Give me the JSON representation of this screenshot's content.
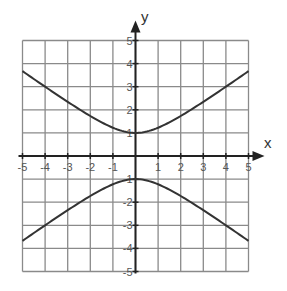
{
  "chart_data": {
    "type": "line",
    "title": "",
    "xlabel": "x",
    "ylabel": "y",
    "xlim": [
      -5,
      5
    ],
    "ylim": [
      -5,
      5
    ],
    "grid": true,
    "legend": null,
    "x_ticks": [
      "-5",
      "-4",
      "-3",
      "-2",
      "-1",
      "1",
      "2",
      "3",
      "4",
      "5"
    ],
    "y_ticks": [
      "5",
      "4",
      "3",
      "2",
      "1",
      "-1",
      "-2",
      "-3",
      "-4",
      "-5"
    ],
    "equation": "y^2 - x^2/2 = 1",
    "series": [
      {
        "name": "upper branch",
        "x": [
          -5,
          -4,
          -3,
          -2,
          -1,
          0,
          1,
          2,
          3,
          4,
          5
        ],
        "y": [
          3.67,
          3.0,
          2.35,
          1.73,
          1.22,
          1.0,
          1.22,
          1.73,
          2.35,
          3.0,
          3.67
        ]
      },
      {
        "name": "lower branch",
        "x": [
          -5,
          -4,
          -3,
          -2,
          -1,
          0,
          1,
          2,
          3,
          4,
          5
        ],
        "y": [
          -3.67,
          -3.0,
          -2.35,
          -1.73,
          -1.22,
          -1.0,
          -1.22,
          -1.73,
          -2.35,
          -3.0,
          -3.67
        ]
      }
    ]
  },
  "labels": {
    "x_axis": "x",
    "y_axis": "y"
  },
  "colors": {
    "grid": "#8a8a8a",
    "axis": "#222222",
    "curve": "#333333",
    "tick_text": "#555555"
  }
}
